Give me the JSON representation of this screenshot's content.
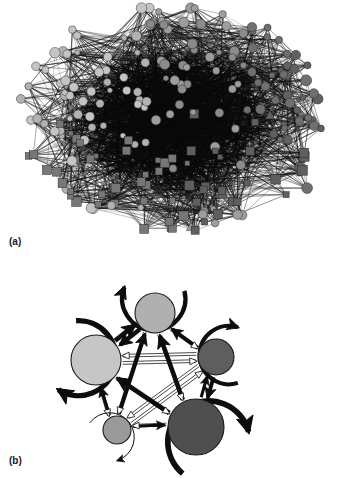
{
  "figure": {
    "caption_labels": {
      "panel_a": "(a)",
      "panel_b": "(b)"
    },
    "background_color": "#ffffff"
  },
  "panel_a": {
    "name": "full-network-graph",
    "description": "Dense directed network of many nodes drawn with a force/circular layout; hairball appearance with near-black edge core",
    "node_count": 214,
    "edge_color": "#121212",
    "node_shapes": [
      "circle",
      "square",
      "triangle"
    ],
    "node_shape_counts": {
      "circle": 150,
      "square": 60,
      "triangle": 4
    },
    "node_colors": {
      "light_gray": "#b9b9b9",
      "mid_gray": "#8f8f8f",
      "dark_gray": "#5d5d5d",
      "very_light": "#d0d0d0"
    },
    "groups": [
      {
        "label": "circles-light",
        "shape": "circle",
        "color": "#c0c0c0",
        "region": "upper-left"
      },
      {
        "label": "circles-mid",
        "shape": "circle",
        "color": "#8f8f8f",
        "region": "center"
      },
      {
        "label": "circles-dark",
        "shape": "circle",
        "color": "#5f5f5f",
        "region": "right"
      },
      {
        "label": "squares",
        "shape": "square",
        "color": "#6e6e6e",
        "region": "lower"
      },
      {
        "label": "triangles",
        "shape": "triangle",
        "color": "#a8a8a8",
        "region": "center"
      }
    ],
    "layout_hint": "radial hairball, extent approx x 18-330, y 8-232"
  },
  "chart_data": {
    "type": "diagram",
    "title": "",
    "subtitle": "",
    "panels": [
      {
        "id": "a",
        "label": "(a)",
        "type": "network-graph",
        "directed": true,
        "node_count": 214,
        "description": "Original fine-grained directed network (hairball)"
      },
      {
        "id": "b",
        "label": "(b)",
        "type": "coarse-grained-network",
        "directed": true,
        "self_loops": true,
        "weighted_edges": true,
        "node_count": 5,
        "nodes": [
          {
            "id": "n1",
            "name": "top",
            "cx": 155,
            "cy": 313,
            "r": 20,
            "color": "#b0b0b0",
            "self_loop": true,
            "self_loop_weight": 3.2,
            "self_loop_side": "top",
            "size_rank": 3
          },
          {
            "id": "n2",
            "name": "left",
            "cx": 96,
            "cy": 360,
            "r": 25,
            "color": "#c6c6c6",
            "self_loop": true,
            "self_loop_weight": 4.0,
            "self_loop_side": "left",
            "size_rank": 2
          },
          {
            "id": "n3",
            "name": "right",
            "cx": 216,
            "cy": 357,
            "r": 18,
            "color": "#5e5e5e",
            "self_loop": true,
            "self_loop_weight": 3.0,
            "self_loop_side": "right",
            "size_rank": 4
          },
          {
            "id": "n4",
            "name": "bottom-left",
            "cx": 117,
            "cy": 430,
            "r": 14,
            "color": "#9a9a9a",
            "self_loop": true,
            "self_loop_weight": 0.9,
            "self_loop_side": "bottom",
            "size_rank": 5
          },
          {
            "id": "n5",
            "name": "bottom-right",
            "cx": 196,
            "cy": 427,
            "r": 28,
            "color": "#4f4f4f",
            "self_loop": true,
            "self_loop_weight": 4.2,
            "self_loop_side": "bottom",
            "size_rank": 1
          }
        ],
        "edges": [
          {
            "from": "n1",
            "to": "n2",
            "weight": 3.4,
            "style": "solid-thick"
          },
          {
            "from": "n2",
            "to": "n1",
            "weight": 3.6,
            "style": "solid-thick"
          },
          {
            "from": "n3",
            "to": "n1",
            "weight": 3.0,
            "style": "solid-thick"
          },
          {
            "from": "n1",
            "to": "n3",
            "weight": 1.0,
            "style": "outline-thin"
          },
          {
            "from": "n4",
            "to": "n1",
            "weight": 3.2,
            "style": "solid-thick"
          },
          {
            "from": "n1",
            "to": "n4",
            "weight": 0.7,
            "style": "outline-thin"
          },
          {
            "from": "n5",
            "to": "n1",
            "weight": 3.5,
            "style": "solid-thick"
          },
          {
            "from": "n1",
            "to": "n5",
            "weight": 1.0,
            "style": "outline-thin"
          },
          {
            "from": "n3",
            "to": "n2",
            "weight": 1.0,
            "style": "outline-thin"
          },
          {
            "from": "n2",
            "to": "n3",
            "weight": 1.0,
            "style": "outline-thin"
          },
          {
            "from": "n4",
            "to": "n2",
            "weight": 2.6,
            "style": "solid-thick"
          },
          {
            "from": "n2",
            "to": "n4",
            "weight": 1.0,
            "style": "outline-thin"
          },
          {
            "from": "n5",
            "to": "n2",
            "weight": 3.6,
            "style": "solid-thick"
          },
          {
            "from": "n2",
            "to": "n5",
            "weight": 1.0,
            "style": "outline-thin"
          },
          {
            "from": "n3",
            "to": "n5",
            "weight": 3.0,
            "style": "solid-thick"
          },
          {
            "from": "n5",
            "to": "n3",
            "weight": 2.4,
            "style": "solid-thick"
          },
          {
            "from": "n4",
            "to": "n3",
            "weight": 1.0,
            "style": "outline-thin"
          },
          {
            "from": "n3",
            "to": "n4",
            "weight": 1.0,
            "style": "outline-thin"
          },
          {
            "from": "n4",
            "to": "n5",
            "weight": 2.4,
            "style": "solid-thick"
          },
          {
            "from": "n5",
            "to": "n4",
            "weight": 1.0,
            "style": "outline-thin"
          }
        ],
        "edge_color": "#0d0d0d",
        "node_stroke": "#1a1a1a",
        "description": "Five-node pentagon summary graph with self-loops; arrow thickness encodes edge weight"
      }
    ]
  }
}
